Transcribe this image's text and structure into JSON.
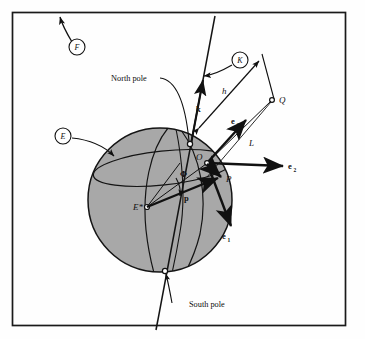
{
  "figure": {
    "type": "geodetic-reference-diagram",
    "frame": {
      "border_color": "#1a1a1a"
    },
    "sphere": {
      "fill_color": "#a8a8a8",
      "stroke_color": "#141414"
    }
  },
  "labels": {
    "north_pole": "North pole",
    "south_pole": "South pole",
    "circled_E": "E",
    "circled_F": "F",
    "circled_K": "K",
    "point_O": "O",
    "point_P": "P",
    "point_Q": "Q",
    "point_E_star": "E*",
    "vector_k": "k",
    "vector_p_lower": "p",
    "vector_P_upper": "P",
    "distance_h": "h",
    "distance_L": "L",
    "angle_phi": "Φ",
    "basis_e1": "e",
    "basis_e1_sub": "1",
    "basis_e2": "e",
    "basis_e2_sub": "2",
    "basis_e3": "e",
    "basis_e3_sub": "3"
  }
}
